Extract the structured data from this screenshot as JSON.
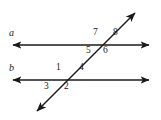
{
  "figure": {
    "background_color": "#ffffff",
    "stroke_color": "#1a1a1a",
    "text_color": "#1a1a1a",
    "width": 161,
    "height": 120
  },
  "lines": [
    {
      "id": "line-a",
      "label": "a",
      "type": "double-arrow-horizontal",
      "x1": 10,
      "y1": 45,
      "x2": 152,
      "y2": 45,
      "label_x": 10,
      "label_y": 29
    },
    {
      "id": "line-b",
      "label": "b",
      "type": "double-arrow-horizontal",
      "x1": 10,
      "y1": 80,
      "x2": 152,
      "y2": 80,
      "label_x": 10,
      "label_y": 64
    },
    {
      "id": "transversal",
      "label": "",
      "type": "double-arrow-diagonal",
      "x1": 34,
      "y1": 114,
      "x2": 138,
      "y2": 10
    }
  ],
  "angles": [
    {
      "id": "angle-1",
      "label": "1",
      "x": 56,
      "y": 63
    },
    {
      "id": "angle-2",
      "label": "2",
      "x": 64,
      "y": 82
    },
    {
      "id": "angle-3",
      "label": "3",
      "x": 45,
      "y": 82
    },
    {
      "id": "angle-4",
      "label": "4",
      "x": 79,
      "y": 63
    },
    {
      "id": "angle-5",
      "label": "5",
      "x": 86,
      "y": 45
    },
    {
      "id": "angle-6",
      "label": "6",
      "x": 103,
      "y": 45
    },
    {
      "id": "angle-7",
      "label": "7",
      "x": 93,
      "y": 28
    },
    {
      "id": "angle-8",
      "label": "8",
      "x": 113,
      "y": 28
    }
  ]
}
